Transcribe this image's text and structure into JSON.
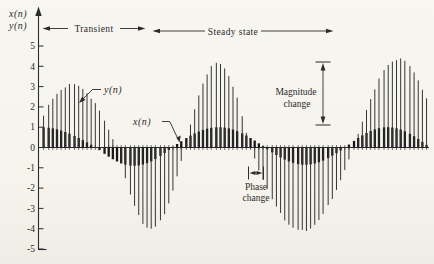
{
  "figure": {
    "background": "#f5f3ec",
    "ink_color": "#2b2b2b"
  },
  "axis": {
    "ylabel_line1": "x(n)",
    "ylabel_line2": "y(n)"
  },
  "annotations": {
    "transient": "Transient",
    "steady_state": "Steady state",
    "magnitude_line1": "Magnitude",
    "magnitude_line2": "change",
    "phase_line1": "Phase",
    "phase_line2": "change",
    "output_callout": "y(n)",
    "input_callout": "x(n)"
  },
  "chart_data": {
    "type": "stem",
    "ylabel": "x(n), y(n)",
    "ylim": [
      -5,
      5
    ],
    "y_tick_values": [
      5,
      4,
      3,
      2,
      1,
      0,
      -1,
      -2,
      -3,
      -4,
      -5
    ],
    "grid": false,
    "regions": [
      {
        "label": "Transient",
        "span": "left portion of record"
      },
      {
        "label": "Steady state",
        "span": "middle-right portion of record"
      }
    ],
    "input_amplitude": 1.0,
    "steady_state_output_amplitude": 4.3,
    "magnitude_change_marker_values": [
      1.1,
      4.2
    ],
    "phase_change_marker_px": [
      248,
      264
    ],
    "series": [
      {
        "name": "x(n)",
        "role": "input",
        "style": "thick-dark-stems",
        "stroke_width": 2.3,
        "color": "#171717",
        "zero_crossings_px": [
          -15,
          96,
          172,
          265,
          345,
          430
        ],
        "lobe_peak_values": [
          1.0,
          -0.9,
          1.0,
          -0.85,
          1.0
        ]
      },
      {
        "name": "y(n)",
        "role": "output",
        "style": "thin-tall-stems",
        "stroke_width": 1.0,
        "color": "#343434",
        "zero_crossings_px": [
          28,
          117,
          185,
          250,
          354,
          443
        ],
        "lobe_peak_values": [
          3.1,
          -4.0,
          4.15,
          -4.1,
          4.35
        ]
      }
    ],
    "sampling": {
      "first_stem_px": 44,
      "stem_spacing_px": 4.3,
      "stem_count": 90,
      "y_zero_px": 147.5,
      "px_per_unit": 20.3
    }
  }
}
